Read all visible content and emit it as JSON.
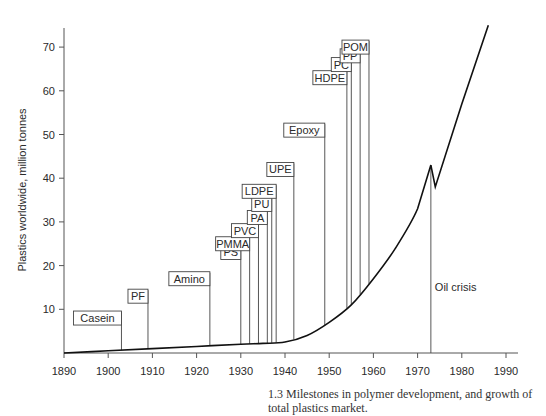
{
  "chart_data": {
    "type": "line",
    "title": "",
    "caption": "1.3   Milestones in polymer development, and growth of total plastics market.",
    "xlabel": "",
    "ylabel": "Plastics worldwide, million tonnes",
    "xlim": [
      1890,
      1992
    ],
    "ylim": [
      0,
      75
    ],
    "x_ticks": [
      1890,
      1900,
      1910,
      1920,
      1930,
      1940,
      1950,
      1960,
      1970,
      1980,
      1990
    ],
    "y_ticks": [
      10,
      20,
      30,
      40,
      50,
      60,
      70
    ],
    "grid": false,
    "legend": null,
    "series": [
      {
        "name": "Total plastics production",
        "x": [
          1890,
          1900,
          1910,
          1920,
          1930,
          1935,
          1940,
          1945,
          1950,
          1955,
          1960,
          1965,
          1970,
          1973,
          1974,
          1980,
          1986
        ],
        "values": [
          0,
          0.5,
          1,
          1.5,
          2,
          2.2,
          2.5,
          4,
          7,
          11,
          17,
          24,
          33,
          43,
          38,
          57,
          75
        ]
      }
    ],
    "annotations": [
      {
        "label": "Casein",
        "year": 1903,
        "label_y": 8
      },
      {
        "label": "PF",
        "year": 1909,
        "label_y": 13
      },
      {
        "label": "Amino",
        "year": 1923,
        "label_y": 17
      },
      {
        "label": "PS",
        "year": 1930,
        "label_y": 23
      },
      {
        "label": "PMMA",
        "year": 1932,
        "label_y": 25
      },
      {
        "label": "PVC",
        "year": 1934,
        "label_y": 28
      },
      {
        "label": "PA",
        "year": 1936,
        "label_y": 31
      },
      {
        "label": "PU",
        "year": 1937,
        "label_y": 34
      },
      {
        "label": "LDPE",
        "year": 1938,
        "label_y": 37
      },
      {
        "label": "UPE",
        "year": 1942,
        "label_y": 42
      },
      {
        "label": "Epoxy",
        "year": 1949,
        "label_y": 51
      },
      {
        "label": "HDPE",
        "year": 1954,
        "label_y": 63
      },
      {
        "label": "PC",
        "year": 1955,
        "label_y": 66
      },
      {
        "label": "PP",
        "year": 1957,
        "label_y": 68
      },
      {
        "label": "POM",
        "year": 1959,
        "label_y": 70
      },
      {
        "label": "Oil crisis",
        "year": 1973,
        "label_y": 15
      }
    ]
  }
}
